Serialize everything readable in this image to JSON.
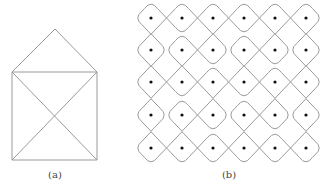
{
  "figure_a": {
    "label": "(a)",
    "label_pos": [
      55,
      170
    ],
    "stroke": "#9a9a9a",
    "points": {
      "apex": [
        55,
        29
      ],
      "top_left": [
        12,
        72
      ],
      "top_right": [
        97,
        72
      ],
      "bottom_left": [
        12,
        160
      ],
      "bottom_right": [
        97,
        160
      ]
    }
  },
  "figure_b": {
    "label": "(b)",
    "label_pos": [
      229,
      170
    ],
    "stroke": "#9a9a9a",
    "dot_color": "#111111",
    "cols_x": [
      151,
      182,
      213,
      244,
      275,
      306
    ],
    "rows_y": [
      18,
      50,
      82,
      115,
      148
    ],
    "horizontal_cross": [
      [
        1,
        1,
        1,
        1,
        1
      ],
      [
        0,
        1,
        0,
        1,
        0
      ],
      [
        1,
        1,
        1,
        1,
        1
      ],
      [
        0,
        1,
        0,
        1,
        0
      ],
      [
        1,
        1,
        1,
        1,
        1
      ]
    ],
    "vertical_cross": [
      [
        1,
        0,
        1,
        0,
        1,
        1
      ],
      [
        1,
        1,
        0,
        1,
        0,
        1
      ],
      [
        1,
        0,
        1,
        0,
        1,
        1
      ],
      [
        1,
        1,
        0,
        1,
        0,
        1
      ]
    ]
  }
}
